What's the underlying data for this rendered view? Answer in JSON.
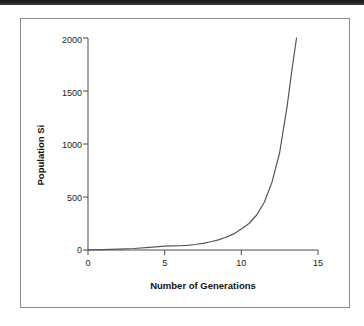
{
  "figure": {
    "background_color": "#ffffff",
    "frame_color": "#8a8a8a",
    "scan_artifact_color": "#1a1a1a"
  },
  "chart_data": {
    "type": "line",
    "title": "",
    "subtitle": "",
    "xlabel": "Number of Generations",
    "ylabel": "Population Si",
    "xlim": [
      0,
      15
    ],
    "ylim": [
      0,
      2000
    ],
    "xticks": [
      "0",
      "5",
      "10",
      "15"
    ],
    "xtick_values": [
      0,
      5,
      10,
      15
    ],
    "yticks": [
      "0",
      "500",
      "1000",
      "1500",
      "2000"
    ],
    "ytick_values": [
      0,
      500,
      1000,
      1500,
      2000
    ],
    "grid": false,
    "legend": false,
    "legend_position": "none",
    "line_color": "#555555",
    "line_width": 1.2,
    "series": [
      {
        "name": "Population Size",
        "x": [
          0,
          1,
          2,
          3,
          4,
          5,
          5.5,
          6,
          6.5,
          7,
          7.5,
          8,
          8.5,
          9,
          9.5,
          10,
          10.5,
          11,
          11.5,
          12,
          12.5,
          13,
          13.3,
          13.6
        ],
        "values": [
          2,
          4,
          8,
          14,
          24,
          36,
          38,
          40,
          44,
          52,
          62,
          78,
          96,
          120,
          152,
          198,
          250,
          330,
          450,
          640,
          920,
          1370,
          1700,
          2000
        ]
      }
    ]
  }
}
